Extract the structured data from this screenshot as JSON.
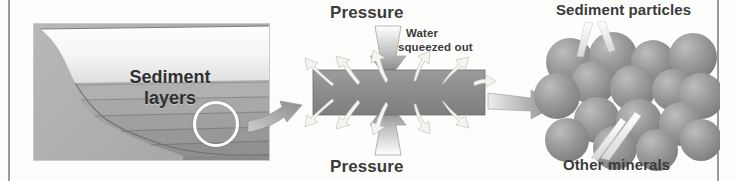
{
  "figure": {
    "background_color": "#fdfdfc",
    "rule_color": "#9a9a9a"
  },
  "panels": {
    "cross_section": {
      "name": "Sea-floor sediment cross-section",
      "label_line1": "Sediment",
      "label_line2": "layers",
      "water_color_top": "#ffffff",
      "water_color_bottom": "#e9e9e9",
      "sediment_colors": [
        "#b3b3b3",
        "#aaaaaa",
        "#a2a2a2",
        "#9a9a9a",
        "#939393",
        "#8c8c8c"
      ],
      "marker": "circle-highlight"
    },
    "compaction": {
      "name": "Compaction under pressure",
      "pressure_top_label": "Pressure",
      "pressure_bottom_label": "Pressure",
      "water_label_line1": "Water",
      "water_label_line2": "squeezed out",
      "rock_color": "#8e8e8e",
      "arrow_color": "#8a8a8a"
    },
    "particles": {
      "name": "Cemented sediment particles",
      "top_label": "Sediment particles",
      "bottom_label": "Other minerals",
      "particle_color": "#9b9b9b",
      "cement_color": "#f2f2ee",
      "particle_count": 16
    }
  },
  "connectors": [
    {
      "name": "cross-section-to-compaction",
      "style": "curved-tapered-arrow"
    },
    {
      "name": "compaction-to-particles",
      "style": "straight-tapered-arrow"
    }
  ]
}
